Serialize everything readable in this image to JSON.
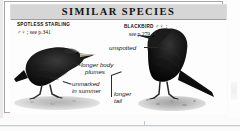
{
  "panel": {
    "title": "SIMILAR SPECIES"
  },
  "species": [
    {
      "name": "SPOTLESS STARLING",
      "reference": "♂♀ ; see p.341",
      "icon": "starling-silhouette"
    },
    {
      "name": "BLACKBIRD",
      "reference": "see p.279",
      "symbols": "♂♀ ;",
      "icon": "blackbird-silhouette"
    }
  ],
  "annotations": [
    {
      "id": "unspotted",
      "text": "unspotted"
    },
    {
      "id": "longer-body-plumes",
      "line1": "longer body",
      "line2": "plumes"
    },
    {
      "id": "unmarked-in-summer",
      "line1": "unmarked",
      "line2": "in summer"
    },
    {
      "id": "longer-tail",
      "line1": "longer",
      "line2": "tail"
    }
  ],
  "colors": {
    "header_background": "#d6d6d6",
    "panel_border": "#a9a9a9",
    "text": "#111111",
    "bird_body": "#141414",
    "ground": "#b5b5b5"
  }
}
